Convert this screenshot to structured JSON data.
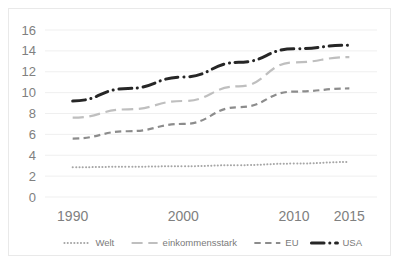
{
  "chart_data": {
    "type": "line",
    "title": "",
    "subtitle": "",
    "xlabel": "",
    "ylabel": "",
    "categories": [
      "1990",
      "1995",
      "2000",
      "2005",
      "2010",
      "2015"
    ],
    "x_tick_labels": [
      "1990",
      "2000",
      "2010",
      "2015"
    ],
    "y_tick_labels": [
      "0",
      "2",
      "4",
      "6",
      "8",
      "10",
      "12",
      "14",
      "16"
    ],
    "ylim": [
      0,
      16
    ],
    "y_tick_step": 2,
    "grid": "horizontal",
    "legend_position": "bottom",
    "series": [
      {
        "name": "Welt",
        "style": "dotted",
        "color": "#a6a6a6",
        "width": 2,
        "values": [
          2.85,
          2.9,
          2.95,
          3.05,
          3.2,
          3.35
        ]
      },
      {
        "name": "einkommensstark",
        "style": "long-dash",
        "color": "#bfbfbf",
        "width": 2.2,
        "values": [
          7.6,
          8.4,
          9.2,
          10.6,
          12.9,
          13.4
        ]
      },
      {
        "name": "EU",
        "style": "dash",
        "color": "#8c8c8c",
        "width": 2.2,
        "values": [
          5.6,
          6.3,
          7.0,
          8.6,
          10.1,
          10.4
        ]
      },
      {
        "name": "USA",
        "style": "dash-dot",
        "color": "#262626",
        "width": 3,
        "values": [
          9.2,
          10.4,
          11.5,
          12.9,
          14.2,
          14.55
        ]
      }
    ]
  },
  "legend": {
    "items": [
      {
        "label": "Welt",
        "style": "dotted",
        "color": "#a6a6a6"
      },
      {
        "label": "einkommensstark",
        "style": "long-dash",
        "color": "#bfbfbf"
      },
      {
        "label": "EU",
        "style": "dash",
        "color": "#8c8c8c"
      },
      {
        "label": "USA",
        "style": "dash-dot",
        "color": "#262626"
      }
    ]
  },
  "axes": {
    "y_ticks": [
      "16",
      "14",
      "12",
      "10",
      "8",
      "6",
      "4",
      "2",
      "0"
    ],
    "x_ticks": [
      "1990",
      "2000",
      "2010",
      "2015"
    ]
  },
  "colors": {
    "gridline": "#efefef",
    "axis_text": "#808080",
    "legend_text": "#7a7a7a",
    "frame": "#e9e9e9",
    "background": "#ffffff"
  }
}
